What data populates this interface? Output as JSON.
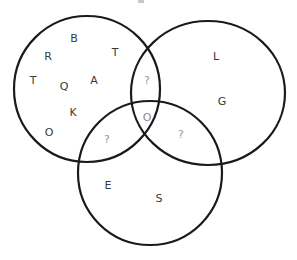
{
  "diagram": {
    "type": "venn-3",
    "colors": {
      "stroke": "#1a1a1a",
      "known_letter": "#3a3a3a",
      "unknown_marker": "#9a9a9a",
      "center_letter": "#8a8a8a",
      "background": "#ffffff"
    },
    "circles": [
      {
        "id": "left",
        "cx": 87,
        "cy": 89,
        "r": 73
      },
      {
        "id": "right",
        "cx": 208,
        "cy": 93,
        "rx": 77,
        "ry": 72
      },
      {
        "id": "bottom",
        "cx": 150,
        "cy": 173,
        "r": 72
      }
    ],
    "regions": {
      "left_only": {
        "letters": [
          {
            "text": "B",
            "x": 74,
            "y": 38
          },
          {
            "text": "R",
            "x": 48,
            "y": 56
          },
          {
            "text": "T",
            "x": 115,
            "y": 52
          },
          {
            "text": "T",
            "x": 33,
            "y": 80
          },
          {
            "text": "Q",
            "x": 64,
            "y": 86
          },
          {
            "text": "A",
            "x": 94,
            "y": 80
          },
          {
            "text": "K",
            "x": 73,
            "y": 112
          },
          {
            "text": "O",
            "x": 49,
            "y": 132
          }
        ]
      },
      "right_only": {
        "letters": [
          {
            "text": "L",
            "x": 216,
            "y": 56
          },
          {
            "text": "G",
            "x": 222,
            "y": 101
          }
        ]
      },
      "bottom_only": {
        "letters": [
          {
            "text": "E",
            "x": 108,
            "y": 185
          },
          {
            "text": "S",
            "x": 159,
            "y": 198
          }
        ]
      },
      "left_right": {
        "letters": [
          {
            "text": "?",
            "x": 147,
            "y": 80
          }
        ]
      },
      "left_bottom": {
        "letters": [
          {
            "text": "?",
            "x": 107,
            "y": 139
          }
        ]
      },
      "right_bottom": {
        "letters": [
          {
            "text": "?",
            "x": 181,
            "y": 134
          }
        ]
      },
      "all_three": {
        "letters": [
          {
            "text": "O",
            "x": 147,
            "y": 117
          }
        ]
      }
    }
  }
}
